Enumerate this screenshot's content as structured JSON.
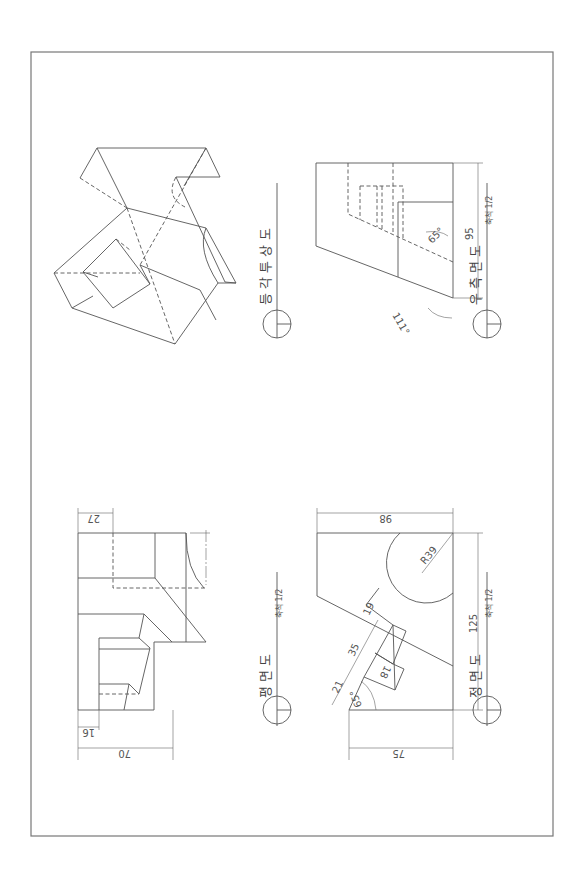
{
  "sheet": {
    "orientation": "rotated 90 degrees",
    "views": {
      "isometric": {
        "title": "등 각 투 상 도"
      },
      "right_side": {
        "title": "우 측 면 도",
        "scale": "축척 1/2",
        "dims": {
          "height": "95",
          "angle_inner": "65°",
          "angle_outer": "111°"
        }
      },
      "plan": {
        "title": "평 면 도",
        "scale": "축척 1/2",
        "dims": {
          "width": "70",
          "offset_left": "16",
          "offset_top": "27"
        }
      },
      "front": {
        "title": "정 면 도",
        "scale": "축척 1/2",
        "dims": {
          "top": "98",
          "height": "125",
          "bottom": "75",
          "radius": "R39",
          "d19": "19",
          "d35": "35",
          "d21": "21",
          "d18": "18",
          "angle": "65°"
        }
      }
    }
  }
}
